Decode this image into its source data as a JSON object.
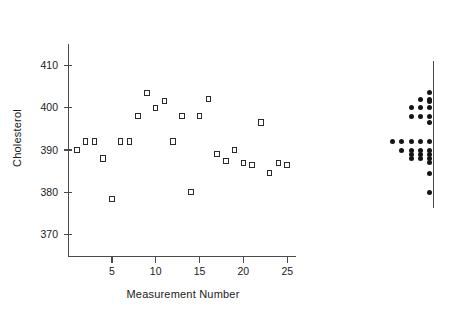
{
  "chart_data": {
    "type": "scatter",
    "title": "",
    "xlabel": "Measurement Number",
    "ylabel": "Cholesterol",
    "xlim": [
      0,
      26
    ],
    "ylim": [
      365,
      415
    ],
    "grid": false,
    "legend": "none",
    "xticks": [
      5,
      10,
      15,
      20,
      25
    ],
    "yticks": [
      370,
      380,
      390,
      400,
      410
    ],
    "x": [
      1,
      2,
      3,
      4,
      5,
      6,
      7,
      8,
      9,
      10,
      11,
      12,
      13,
      14,
      15,
      16,
      17,
      18,
      19,
      20,
      21,
      22,
      23,
      24,
      25
    ],
    "values": [
      390,
      392,
      392,
      388,
      378.5,
      392,
      392,
      398,
      403.5,
      400,
      401.5,
      392,
      398,
      380,
      398,
      402,
      389,
      387.5,
      390,
      387,
      386.5,
      396.5,
      384.5,
      387,
      386.5
    ],
    "marker": "open-square",
    "companion_plot": {
      "type": "dotplot",
      "orientation": "horizontal-stacked-left",
      "description": "Marginal dot plot of the same Cholesterol values, one dot per observation, stacked leftward from a vertical reference line.",
      "bins": [
        {
          "value": 403.5,
          "count": 1
        },
        {
          "value": 402,
          "count": 2
        },
        {
          "value": 401.5,
          "count": 1
        },
        {
          "value": 400,
          "count": 3
        },
        {
          "value": 398,
          "count": 3
        },
        {
          "value": 396.5,
          "count": 1
        },
        {
          "value": 392,
          "count": 5
        },
        {
          "value": 390,
          "count": 4
        },
        {
          "value": 389,
          "count": 3
        },
        {
          "value": 388,
          "count": 3
        },
        {
          "value": 387,
          "count": 1
        },
        {
          "value": 384.5,
          "count": 1
        },
        {
          "value": 380,
          "count": 1
        }
      ]
    }
  },
  "axes": {
    "y_title": "Cholesterol",
    "x_title": "Measurement Number",
    "y_tick_labels": [
      "410",
      "400",
      "390",
      "380",
      "370"
    ],
    "x_tick_labels": [
      "5",
      "10",
      "15",
      "20",
      "25"
    ]
  }
}
